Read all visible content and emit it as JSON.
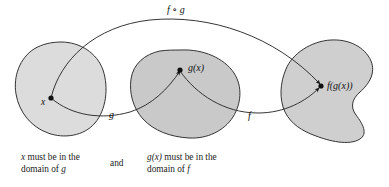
{
  "figure": {
    "title_label": "f ∘ g",
    "background_color": "#ffffff",
    "stroke_color": "#222222",
    "sets": [
      {
        "name": "domain-of-g",
        "fill": "#dcdcdc",
        "point_label": "x",
        "position": "left"
      },
      {
        "name": "domain-of-f",
        "fill": "#c9c9c9",
        "point_label": "g(x)",
        "position": "middle"
      },
      {
        "name": "range-of-f",
        "fill": "#cfcfcf",
        "point_label": "f(g(x))",
        "position": "right"
      }
    ],
    "arrows": [
      {
        "name": "g-arrow",
        "label": "g"
      },
      {
        "name": "f-arrow",
        "label": "f"
      },
      {
        "name": "fog-arrow",
        "label": "f ∘ g"
      }
    ]
  },
  "captions": {
    "left": {
      "line1_var": "x",
      "line1_rest": " must be in the",
      "line2_rest": "domain of ",
      "line2_var": "g"
    },
    "connector": "and",
    "right": {
      "line1_var": "g(x)",
      "line1_rest": " must be in the",
      "line2_rest": "domain of ",
      "line2_var": "f"
    }
  },
  "points": {
    "x": "x",
    "gx": "g(x)",
    "fgx": "f(g(x))"
  }
}
